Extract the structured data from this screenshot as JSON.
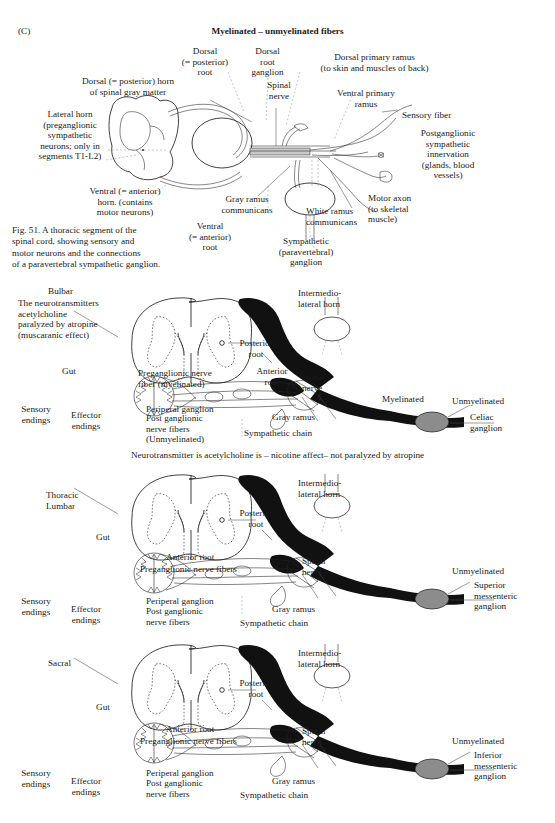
{
  "figure": {
    "panel_letter": "(C)",
    "title": "Myelinated – unmyelinated fibers",
    "caption": "Fig. 51. A thoracic segment of the\nspinal cord, showing sensory and\nmotor neurons and the connections\nof a paravertebral sympathetic ganglion.",
    "colors": {
      "ink": "#1a1a1a",
      "leader": "#4a4a4a",
      "ganglion_fill": "#8c8c8c",
      "nerve_black": "#111111"
    }
  },
  "top_diagram": {
    "labels": {
      "dorsal_root": "Dorsal\n(= posterior)\nroot",
      "dorsal_root_ganglion": "Dorsal\nroot\nganglion",
      "dorsal_primary_ramus": "Dorsal primary ramus\n(to skin and muscles of back)",
      "dorsal_horn": "Dorsal (= posterior) horn\nof spinal gray matter",
      "spinal_nerve": "Spinal\nnerve",
      "ventral_primary_ramus": "Ventral primary\nramus",
      "sensory_fiber": "Sensory fiber",
      "lateral_horn": "Lateral horn\n(preganglionic\nsympathetic\nneurons; only in\nsegments T1-L2)",
      "postganglionic": "Postganglionic\nsympathetic\ninnervation\n(glands, blood\nvessels)",
      "ventral_horn": "Ventral (= anterior)\nhorn. (contains\nmotor neurons)",
      "ventral_root": "Ventral\n(= anterior)\nroot",
      "gray_ramus": "Gray ramus\ncommunicans",
      "white_ramus": "White ramus\ncommunicans",
      "motor_axon": "Motor axon\n(to skeletal\nmuscle)",
      "sympathetic_ganglion": "Sympathetic\n(paravertebral)\nganglion"
    }
  },
  "sections": [
    {
      "id": "bulbar",
      "name": "Bulbar",
      "note": "The neurotransmitters\nacetylcholine\nparalyzed by atropine\n(muscaranic effect)",
      "gut": "Gut",
      "posterior_root": "Posterior\nroot",
      "anterior_root": "Anterior\nroot",
      "preganglionic": "Preganglionic nerve\nfiber (myelinated)",
      "sensory_endings": "Sensory\nendings",
      "effector_endings": "Effector\nendings",
      "periperal_ganglion": "Periperal ganglion",
      "postganglionic": "Post ganglionic\nnerve fibers\n(Unmyelinated)",
      "gray_ramus": "Gray ramus",
      "sympathetic_chain": "Sympathetic chain",
      "intermediolateral": "Intermedio-\nlateral horn",
      "spinal_nerve": "Spinal\nnerve",
      "myelinated": "Myelinated",
      "unmyelinated": "Unmyelinated",
      "ganglion": "Celiac\nganglion"
    },
    {
      "id": "thoracic-lumbar",
      "name": "Thoracic\nLumbar",
      "note": "",
      "gut": "Gut",
      "posterior_root": "Posterior\nroot",
      "anterior_root": "Anterior root",
      "preganglionic": "Preganglionic nerve fibers",
      "sensory_endings": "Sensory\nendings",
      "effector_endings": "Effector\nendings",
      "periperal_ganglion": "Periperal ganglion",
      "postganglionic": "Post ganglionic\nnerve fibers",
      "gray_ramus": "Gray ramus",
      "sympathetic_chain": "Sympathetic chain",
      "intermediolateral": "Intermedio-\nlateral horn",
      "spinal_nerve": "Spinal\nnerve",
      "myelinated": "",
      "unmyelinated": "Unmyelinated",
      "ganglion": "Superior\nmessenteric\nganglion"
    },
    {
      "id": "sacral",
      "name": "Sacral",
      "note": "",
      "gut": "Gut",
      "posterior_root": "Posterior\nroot",
      "anterior_root": "Anterior root",
      "preganglionic": "Preganglionic nerve fibers",
      "sensory_endings": "Sensory\nendings",
      "effector_endings": "Effector\nendings",
      "periperal_ganglion": "Periperal ganglion",
      "postganglionic": "Post ganglionic\nnerve fibers",
      "gray_ramus": "Gray ramus",
      "sympathetic_chain": "Sympathetic chain",
      "intermediolateral": "Intermedio-\nlateral horn",
      "spinal_nerve": "Spinal\nnerve",
      "myelinated": "",
      "unmyelinated": "Unmyelinated",
      "ganglion": "Inferior\nmessenteric\nganglion"
    }
  ],
  "divider_note": "Neurotransmitter is acetylcholine is – nicotine affect– not paralyzed by atropine"
}
